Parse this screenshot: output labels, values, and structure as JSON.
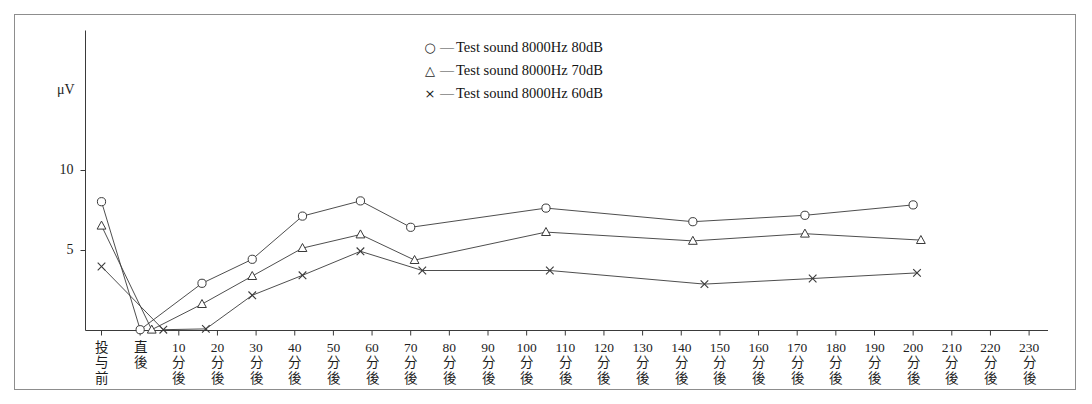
{
  "chart_data": {
    "type": "line",
    "title": "",
    "xlabel": "",
    "ylabel": "μV",
    "ylim": [
      0,
      13.8
    ],
    "yticks": [
      5,
      10
    ],
    "ytick_labels": [
      "5",
      "10"
    ],
    "grid": false,
    "legend_position": "top-center",
    "categories": [
      "投与前",
      "直後",
      "10分後",
      "20分後",
      "30分後",
      "40分後",
      "50分後",
      "60分後",
      "70分後",
      "80分後",
      "90分後",
      "100分後",
      "110分後",
      "120分後",
      "130分後",
      "140分後",
      "150分後",
      "160分後",
      "170分後",
      "180分後",
      "190分後",
      "200分後",
      "210分後",
      "220分後",
      "230分後"
    ],
    "category_labels_vertical": [
      [
        "投",
        "与",
        "前"
      ],
      [
        "直",
        "後"
      ],
      [
        "10",
        "分",
        "後"
      ],
      [
        "20",
        "分",
        "後"
      ],
      [
        "30",
        "分",
        "後"
      ],
      [
        "40",
        "分",
        "後"
      ],
      [
        "50",
        "分",
        "後"
      ],
      [
        "60",
        "分",
        "後"
      ],
      [
        "70",
        "分",
        "後"
      ],
      [
        "80",
        "分",
        "後"
      ],
      [
        "90",
        "分",
        "後"
      ],
      [
        "100",
        "分",
        "後"
      ],
      [
        "110",
        "分",
        "後"
      ],
      [
        "120",
        "分",
        "後"
      ],
      [
        "130",
        "分",
        "後"
      ],
      [
        "140",
        "分",
        "後"
      ],
      [
        "150",
        "分",
        "後"
      ],
      [
        "160",
        "分",
        "後"
      ],
      [
        "170",
        "分",
        "後"
      ],
      [
        "180",
        "分",
        "後"
      ],
      [
        "190",
        "分",
        "後"
      ],
      [
        "200",
        "分",
        "後"
      ],
      [
        "210",
        "分",
        "後"
      ],
      [
        "220",
        "分",
        "後"
      ],
      [
        "230",
        "分",
        "後"
      ]
    ],
    "series": [
      {
        "name": "Test sound 8000Hz 80dB",
        "marker": "circle",
        "points": [
          {
            "x": 0,
            "y": 8.05
          },
          {
            "x": 1.0,
            "y": 0.05
          },
          {
            "x": 2.6,
            "y": 2.95
          },
          {
            "x": 3.9,
            "y": 4.45
          },
          {
            "x": 5.2,
            "y": 7.15
          },
          {
            "x": 6.7,
            "y": 8.1
          },
          {
            "x": 8.0,
            "y": 6.45
          },
          {
            "x": 11.5,
            "y": 7.65
          },
          {
            "x": 15.3,
            "y": 6.8
          },
          {
            "x": 18.2,
            "y": 7.2
          },
          {
            "x": 21.0,
            "y": 7.85
          }
        ]
      },
      {
        "name": "Test sound 8000Hz 70dB",
        "marker": "triangle",
        "points": [
          {
            "x": 0,
            "y": 6.55
          },
          {
            "x": 1.3,
            "y": 0.05
          },
          {
            "x": 2.6,
            "y": 1.65
          },
          {
            "x": 3.9,
            "y": 3.4
          },
          {
            "x": 5.2,
            "y": 5.15
          },
          {
            "x": 6.7,
            "y": 6.0
          },
          {
            "x": 8.1,
            "y": 4.4
          },
          {
            "x": 11.5,
            "y": 6.15
          },
          {
            "x": 15.3,
            "y": 5.6
          },
          {
            "x": 18.2,
            "y": 6.05
          },
          {
            "x": 21.2,
            "y": 5.65
          }
        ]
      },
      {
        "name": "Test sound 8000Hz 60dB",
        "marker": "cross",
        "points": [
          {
            "x": 0,
            "y": 4.0
          },
          {
            "x": 1.6,
            "y": 0.05
          },
          {
            "x": 2.7,
            "y": 0.1
          },
          {
            "x": 3.9,
            "y": 2.2
          },
          {
            "x": 5.2,
            "y": 3.45
          },
          {
            "x": 6.7,
            "y": 4.95
          },
          {
            "x": 8.3,
            "y": 3.75
          },
          {
            "x": 11.6,
            "y": 3.75
          },
          {
            "x": 15.6,
            "y": 2.9
          },
          {
            "x": 18.4,
            "y": 3.25
          },
          {
            "x": 21.1,
            "y": 3.6
          }
        ]
      }
    ]
  },
  "legend": {
    "items": [
      {
        "mark": "○",
        "dash": "—",
        "label": "Test sound 8000Hz 80dB"
      },
      {
        "mark": "△",
        "dash": "—",
        "label": "Test sound 8000Hz 70dB"
      },
      {
        "mark": "×",
        "dash": "—",
        "label": "Test sound 8000Hz 60dB"
      }
    ]
  },
  "style": {
    "line_color": "#3a3a3a",
    "axis_color": "#3a3a3a",
    "frame_color": "#8d8d8d",
    "text_color": "#1d1d1d",
    "background": "#ffffff"
  }
}
